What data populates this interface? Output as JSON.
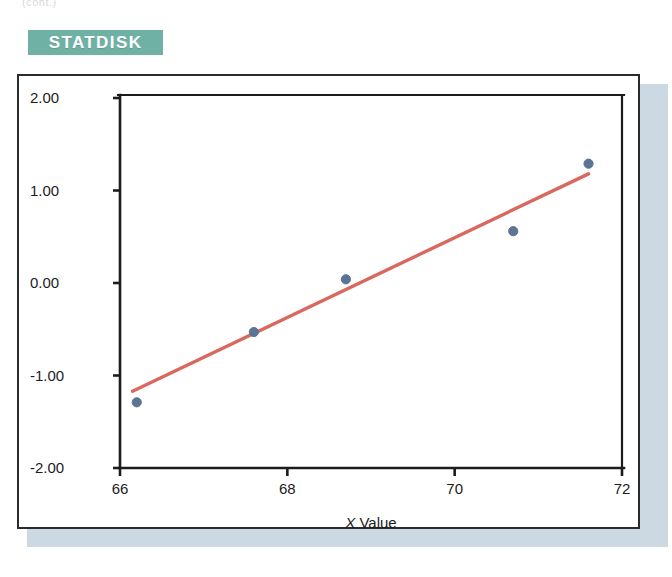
{
  "page": {
    "top_remnant_text": "(cont.)",
    "banner_label": "STATDISK",
    "banner_color": "#6fb2a5",
    "frame_border_color": "#2b2b2b",
    "shadow_color": "#ccd9e2",
    "background_color": "#ffffff"
  },
  "chart_data": {
    "type": "scatter",
    "title": "",
    "subtitle": "",
    "xlabel_prefix": "X",
    "xlabel_suffix": " Value",
    "xlabel": "X Value",
    "ylabel": "",
    "xlim": [
      66,
      72
    ],
    "ylim": [
      -2,
      2
    ],
    "xticks": [
      66,
      68,
      70,
      72
    ],
    "xtick_labels": [
      "66",
      "68",
      "70",
      "72"
    ],
    "yticks": [
      -2,
      -1,
      0,
      1,
      2
    ],
    "ytick_labels": [
      "-2.00",
      "-1.00",
      "0.00",
      "1.00",
      "2.00"
    ],
    "grid": false,
    "legend": "none",
    "point_color": "#5b7494",
    "line_color": "#d9695e",
    "axis_color": "#1c1c1c",
    "points": [
      {
        "x": 66.2,
        "y": -1.29
      },
      {
        "x": 67.6,
        "y": -0.53
      },
      {
        "x": 68.7,
        "y": 0.04
      },
      {
        "x": 70.7,
        "y": 0.56
      },
      {
        "x": 71.6,
        "y": 1.29
      }
    ],
    "series": [
      {
        "name": "Residual points",
        "type": "scatter",
        "x": [
          66.2,
          67.6,
          68.7,
          70.7,
          71.6
        ],
        "values": [
          -1.29,
          -0.53,
          0.04,
          0.56,
          1.29
        ]
      },
      {
        "name": "Fit line",
        "type": "line",
        "x": [
          66.15,
          71.6
        ],
        "values": [
          -1.17,
          1.18
        ]
      }
    ],
    "fit_line": {
      "x_start": 66.15,
      "y_start": -1.17,
      "x_end": 71.6,
      "y_end": 1.18
    }
  }
}
